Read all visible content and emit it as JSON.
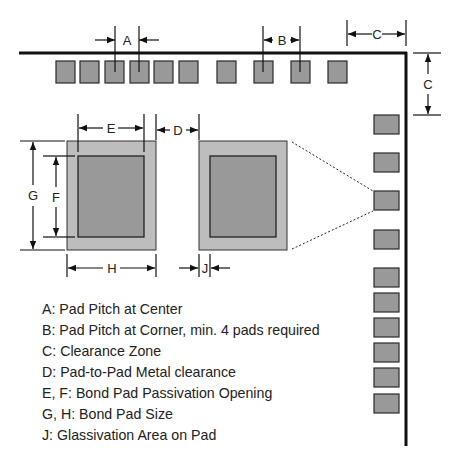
{
  "labels": {
    "A": "A",
    "B": "B",
    "C": "C",
    "D": "D",
    "E": "E",
    "F": "F",
    "G": "G",
    "H": "H",
    "J": "J"
  },
  "legend": [
    "A: Pad Pitch at Center",
    "B: Pad Pitch at Corner, min. 4 pads required",
    "C: Clearance Zone",
    "D: Pad-to-Pad Metal clearance",
    "E, F: Bond Pad Passivation Opening",
    "G, H: Bond Pad Size",
    "J: Glassivation Area on Pad"
  ],
  "colors": {
    "pad_fill": "#999999",
    "pad_border": "#2a2a2a",
    "glassivation_fill": "#bdbdbd",
    "die_edge": "#111111"
  }
}
